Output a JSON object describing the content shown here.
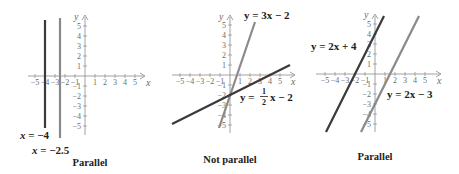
{
  "figures": [
    {
      "id": "graph1",
      "caption": "Parallel",
      "origin": [
        85,
        76
      ],
      "unit": 10,
      "x_ticks": [
        "-5",
        "-4",
        "-3",
        "-2",
        "-1",
        "1",
        "2",
        "3",
        "4",
        "5"
      ],
      "y_ticks": [
        "5",
        "4",
        "3",
        "2",
        "1",
        "-1",
        "-2",
        "-3",
        "-4",
        "-5"
      ],
      "axis_x_label": "x",
      "axis_y_label": "y",
      "lines": [
        {
          "label": "x = −4",
          "type": "vertical",
          "x": -4,
          "color": "#3a3a3a"
        },
        {
          "label": "x = −2.5",
          "type": "vertical",
          "x": -2.5,
          "color": "#8a8a8a"
        }
      ]
    },
    {
      "id": "graph2",
      "caption": "Not parallel",
      "origin": [
        230,
        75
      ],
      "unit": 10,
      "x_ticks": [
        "-5",
        "-4",
        "-3",
        "-2",
        "-1",
        "1",
        "2",
        "3",
        "4",
        "5"
      ],
      "y_ticks": [
        "5",
        "4",
        "3",
        "2",
        "1",
        "-1",
        "-2",
        "-3",
        "-4",
        "-5"
      ],
      "axis_x_label": "x",
      "axis_y_label": "y",
      "lines": [
        {
          "label": "y = 3x − 2",
          "slope": 3,
          "intercept": -2,
          "color": "#8a8a8a"
        },
        {
          "label": "y = ½x − 2",
          "slope": 0.5,
          "intercept": -2,
          "color": "#3a3a3a"
        }
      ]
    },
    {
      "id": "graph3",
      "caption": "Parallel",
      "origin": [
        375,
        74
      ],
      "unit": 10,
      "x_ticks": [
        "-5",
        "-4",
        "-3",
        "-2",
        "-1",
        "1",
        "2",
        "3",
        "4",
        "5"
      ],
      "y_ticks": [
        "5",
        "4",
        "3",
        "2",
        "1",
        "-1",
        "-2",
        "-3",
        "-4",
        "-5"
      ],
      "axis_x_label": "x",
      "axis_y_label": "y",
      "lines": [
        {
          "label": "y = 2x + 4",
          "slope": 2,
          "intercept": 4,
          "color": "#3a3a3a"
        },
        {
          "label": "y = 2x − 3",
          "slope": 2,
          "intercept": -3,
          "color": "#8a8a8a"
        }
      ]
    }
  ],
  "captions": {
    "g1": "Parallel",
    "g2": "Not parallel",
    "g3": "Parallel"
  },
  "equations": {
    "g1_a_lhs": "x",
    "g1_a_rhs": " = −4",
    "g1_b_lhs": "x",
    "g1_b_rhs": " = −2.5",
    "g2_a": "y = 3x − 2",
    "g2_b_pre": "y = ",
    "g2_b_num": "1",
    "g2_b_den": "2",
    "g2_b_post": "x − 2",
    "g3_a": "y = 2x + 4",
    "g3_b": "y = 2x − 3"
  },
  "axis_labels": {
    "x": "x",
    "y": "y"
  },
  "ticks": {
    "neg5": "−5",
    "neg4": "−4",
    "neg3": "−3",
    "neg2": "−2",
    "neg1": "−1",
    "p1": "1",
    "p2": "2",
    "p3": "3",
    "p4": "4",
    "p5": "5"
  }
}
